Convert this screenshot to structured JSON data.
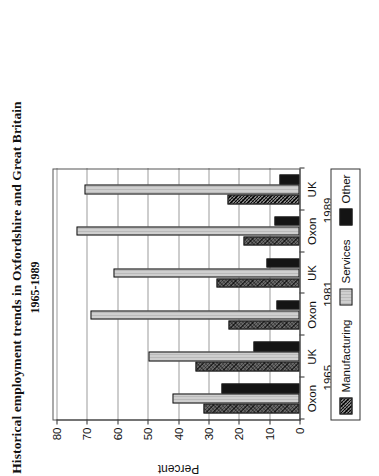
{
  "chart_data": {
    "type": "bar",
    "title": "Historical employment trends in Oxfordshire and Great Britain",
    "subtitle": "1965-1989",
    "xlabel": "",
    "ylabel": "Percent",
    "ylim": [
      0,
      80
    ],
    "ytick_step": 10,
    "yticks": [
      0,
      10,
      20,
      30,
      40,
      50,
      60,
      70,
      80
    ],
    "grid": true,
    "orientation": "rotated-90-ccw",
    "legend_position": "bottom",
    "categories": [
      "Oxon",
      "UK",
      "Oxon",
      "UK",
      "Oxon",
      "UK"
    ],
    "group_labels": [
      "1965",
      "1981",
      "1989"
    ],
    "groups": [
      {
        "year": "1965",
        "regions": [
          {
            "label": "Oxon",
            "manufacturing": 31.7,
            "services": 41.7,
            "other": 25.7
          },
          {
            "label": "UK",
            "manufacturing": 34.3,
            "services": 49.7,
            "other": 15.3
          }
        ]
      },
      {
        "year": "1981",
        "regions": [
          {
            "label": "Oxon",
            "manufacturing": 23.3,
            "services": 68.7,
            "other": 7.7
          },
          {
            "label": "UK",
            "manufacturing": 27.3,
            "services": 61.3,
            "other": 11.0
          }
        ]
      },
      {
        "year": "1989",
        "regions": [
          {
            "label": "Oxon",
            "manufacturing": 18.3,
            "services": 73.3,
            "other": 8.3
          },
          {
            "label": "UK",
            "manufacturing": 23.7,
            "services": 70.7,
            "other": 6.7
          }
        ]
      }
    ],
    "series": [
      {
        "name": "Manufacturing",
        "color": "#4a4a4a",
        "values": [
          31.7,
          34.3,
          23.3,
          27.3,
          18.3,
          23.7
        ]
      },
      {
        "name": "Services",
        "color": "#cfcfcf",
        "values": [
          41.7,
          49.7,
          68.7,
          61.3,
          73.3,
          70.7
        ]
      },
      {
        "name": "Other",
        "color": "#141414",
        "values": [
          25.7,
          15.3,
          7.7,
          11.0,
          8.3,
          6.7
        ]
      }
    ],
    "legend": [
      {
        "name": "Manufacturing",
        "swatch": "manufacturing"
      },
      {
        "name": "Services",
        "swatch": "services"
      },
      {
        "name": "Other",
        "swatch": "other"
      }
    ]
  }
}
